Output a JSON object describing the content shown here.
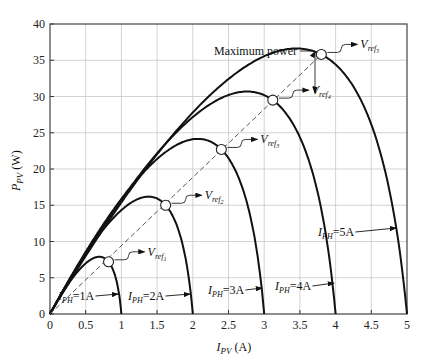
{
  "chart_data": {
    "type": "line",
    "title": "",
    "xlabel": "I_PV (A)",
    "ylabel": "P_PV (W)",
    "xlim": [
      0,
      5
    ],
    "ylim": [
      0,
      40
    ],
    "grid": true,
    "x_ticks": [
      "0",
      "0.5",
      "1",
      "1.5",
      "2",
      "2.5",
      "3",
      "3.5",
      "4",
      "4.5",
      "5"
    ],
    "y_ticks": [
      "0",
      "5",
      "10",
      "15",
      "20",
      "25",
      "30",
      "35",
      "40"
    ],
    "series": [
      {
        "name": "I_PH=1A",
        "isc": 1,
        "mpp": {
          "x": 0.82,
          "y": 7.2
        },
        "vref_label": "V_ref1"
      },
      {
        "name": "I_PH=2A",
        "isc": 2,
        "mpp": {
          "x": 1.62,
          "y": 15.0
        },
        "vref_label": "V_ref2"
      },
      {
        "name": "I_PH=3A",
        "isc": 3,
        "mpp": {
          "x": 2.4,
          "y": 22.7
        },
        "vref_label": "V_ref3"
      },
      {
        "name": "I_PH=4A",
        "isc": 4,
        "mpp": {
          "x": 3.12,
          "y": 29.5
        },
        "vref_label": "V_ref4"
      },
      {
        "name": "I_PH=5A",
        "isc": 5,
        "mpp": {
          "x": 3.8,
          "y": 35.8
        },
        "vref_label": "V_ref5"
      }
    ],
    "annotations": [
      "Maximum power",
      "dashed line through maximum power points"
    ]
  },
  "labels": {
    "x_axis": "I",
    "x_axis_sub": "PV",
    "x_axis_unit": " (A)",
    "y_axis": "P",
    "y_axis_sub": "PV",
    "y_axis_unit": " (W)",
    "max_power": "Maximum power",
    "vref": "V",
    "vref_sub": "ref",
    "iph": "I",
    "iph_sub": "PH",
    "iph_values": [
      "=1A",
      "=2A",
      "=3A",
      "=4A",
      "=5A"
    ],
    "vref_idx": [
      "1",
      "2",
      "3",
      "4",
      "5"
    ]
  }
}
